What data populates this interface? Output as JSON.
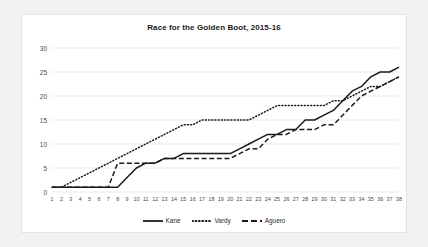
{
  "chart_data": {
    "type": "line",
    "title": "Race for the Golden Boot, 2015-16",
    "xlabel": "",
    "ylabel": "",
    "xlim": [
      1,
      38
    ],
    "ylim": [
      0,
      30
    ],
    "yticks": [
      0,
      5,
      10,
      15,
      20,
      25,
      30
    ],
    "grid": true,
    "legend_position": "bottom",
    "categories": [
      1,
      2,
      3,
      4,
      5,
      6,
      7,
      8,
      9,
      10,
      11,
      12,
      13,
      14,
      15,
      16,
      17,
      18,
      19,
      20,
      21,
      22,
      23,
      24,
      25,
      26,
      27,
      28,
      29,
      30,
      31,
      32,
      33,
      34,
      35,
      36,
      37,
      38
    ],
    "series": [
      {
        "name": "Kane",
        "style": "solid",
        "color": "#1a1a1a",
        "values": [
          1,
          1,
          1,
          1,
          1,
          1,
          1,
          1,
          3,
          5,
          6,
          6,
          7,
          7,
          8,
          8,
          8,
          8,
          8,
          8,
          9,
          10,
          11,
          12,
          12,
          13,
          13,
          15,
          15,
          16,
          17,
          19,
          21,
          22,
          24,
          25,
          25,
          26
        ]
      },
      {
        "name": "Vardy",
        "style": "dotted",
        "color": "#1a1a1a",
        "values": [
          1,
          1,
          2,
          3,
          4,
          5,
          6,
          7,
          8,
          9,
          10,
          11,
          12,
          13,
          14,
          14,
          15,
          15,
          15,
          15,
          15,
          15,
          16,
          17,
          18,
          18,
          18,
          18,
          18,
          18,
          19,
          19,
          20,
          21,
          22,
          22,
          23,
          24
        ]
      },
      {
        "name": "Aguero",
        "style": "dashed",
        "color": "#1a1a1a",
        "values": [
          1,
          1,
          1,
          1,
          1,
          1,
          1,
          6,
          6,
          6,
          6,
          6,
          7,
          7,
          7,
          7,
          7,
          7,
          7,
          7,
          8,
          9,
          9,
          11,
          12,
          12,
          13,
          13,
          13,
          14,
          14,
          16,
          18,
          20,
          21,
          22,
          23,
          24
        ]
      }
    ]
  },
  "legend": {
    "items": [
      {
        "label": "Kane"
      },
      {
        "label": "Vardy"
      },
      {
        "label": "Aguero"
      }
    ]
  }
}
